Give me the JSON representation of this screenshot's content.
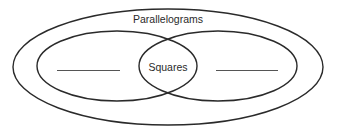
{
  "diagram": {
    "type": "venn",
    "outer_set": {
      "label": "Parallelograms"
    },
    "inner_sets": [
      {
        "position": "left",
        "label": "",
        "blank_line": true
      },
      {
        "position": "right",
        "label": "",
        "blank_line": true
      }
    ],
    "intersection": {
      "label": "Squares"
    },
    "colors": {
      "stroke": "#2a2a2a",
      "background": "#ffffff",
      "blank_line": "#555555"
    }
  }
}
